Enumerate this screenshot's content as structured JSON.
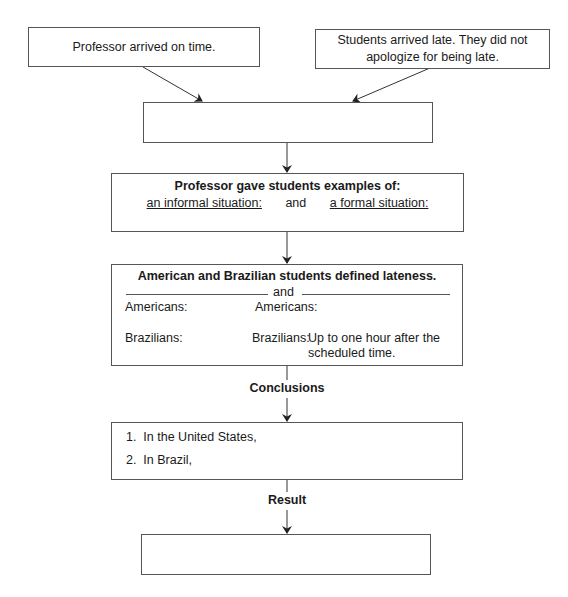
{
  "diagram": {
    "type": "flowchart",
    "nodes": {
      "professor_arrived": {
        "text": "Professor arrived on time."
      },
      "students_arrived": {
        "line1": "Students arrived late. They did not",
        "line2": "apologize for being late."
      },
      "blank_top": {
        "text": ""
      },
      "examples": {
        "title": "Professor gave students examples of:",
        "left": "an informal situation:",
        "connector": "and",
        "right": "a formal situation:"
      },
      "definitions": {
        "title": "American and Brazilian students defined lateness.",
        "divider": "and",
        "left": {
          "americans": "Americans:",
          "brazilians": "Brazilians:"
        },
        "right": {
          "americans": "Americans:",
          "brazilians": "Brazilians:",
          "brazilians_value_line1": "Up to one hour after the",
          "brazilians_value_line2": "scheduled time."
        }
      },
      "conclusions": {
        "items": [
          "1.  In the United States,",
          "2.  In Brazil,"
        ]
      },
      "result": {
        "text": ""
      }
    },
    "edge_labels": {
      "conclusions": "Conclusions",
      "result": "Result"
    }
  }
}
